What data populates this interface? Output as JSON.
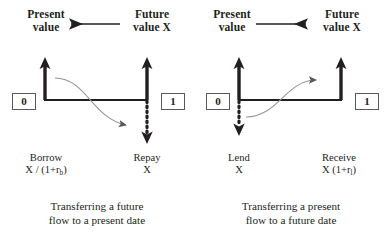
{
  "diagram": {
    "stroke_color": "#231f20",
    "curve_color": "#808285",
    "box_border_color": "#58595b",
    "background": "#ffffff",
    "panels": [
      {
        "id": "borrow",
        "header": {
          "left_line1": "Present",
          "left_line2": "value",
          "arrow_direction": "left",
          "right_line1": "Future",
          "right_line2": "value X"
        },
        "timeline": {
          "start_label": "0",
          "end_label": "1"
        },
        "flows": {
          "left_line1": "Borrow",
          "left_line2_pre": "X / (1+r",
          "left_line2_sub": "b",
          "left_line2_post": ")",
          "right_line1": "Repay",
          "right_line2": "X"
        },
        "caption_line1": "Transferring a future",
        "caption_line2": "flow to a present date",
        "arrows": {
          "start_direction": "up",
          "end_direction": "down",
          "curve_direction": "down-right"
        }
      },
      {
        "id": "lend",
        "header": {
          "left_line1": "Present",
          "left_line2": "value",
          "arrow_direction": "right",
          "right_line1": "Future",
          "right_line2": "value X"
        },
        "timeline": {
          "start_label": "0",
          "end_label": "1"
        },
        "flows": {
          "left_line1": "Lend",
          "left_line2_pre": "X",
          "left_line2_sub": "",
          "left_line2_post": "",
          "right_line1": "Receive",
          "right_line2_pre": "X (1+r",
          "right_line2_sub": "l",
          "right_line2_post": ")"
        },
        "caption_line1": "Transferring a present",
        "caption_line2": "flow to a future date",
        "arrows": {
          "start_direction": "down",
          "end_direction": "up",
          "curve_direction": "up-right"
        }
      }
    ]
  }
}
